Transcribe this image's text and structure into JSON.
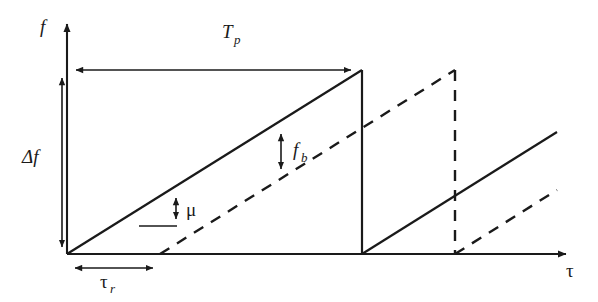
{
  "figure": {
    "background_color": "#ffffff",
    "line_color": "#1a1a1a",
    "width": 598,
    "height": 302
  },
  "axes": {
    "vertical": {
      "label": "f",
      "name": "frequency-axis",
      "x": 67,
      "y_top": 18,
      "y_bottom": 254,
      "label_x": 40,
      "label_y": 33
    },
    "horizontal": {
      "label": "τ",
      "name": "time-axis",
      "y": 254,
      "x_left": 67,
      "x_right": 572,
      "label_x": 566,
      "label_y": 277
    }
  },
  "labels": {
    "sweep_period": {
      "text": "T",
      "subscript": "p",
      "x": 222,
      "y": 38
    },
    "bandwidth": {
      "text": "Δf",
      "subscript": "",
      "x": 22,
      "y": 163
    },
    "round_trip_delay": {
      "text": "τ",
      "subscript": "r",
      "x": 100,
      "y": 288
    },
    "beat_frequency": {
      "text": "f",
      "subscript": "b",
      "x": 293,
      "y": 156
    },
    "chirp_rate": {
      "text": "μ",
      "subscript": "",
      "x": 186,
      "y": 216
    }
  },
  "dimensions": {
    "sweep_period_arrow": {
      "name": "sweep-period-dimension",
      "y": 70,
      "x_start": 70,
      "x_end": 358,
      "heads": "both"
    },
    "bandwidth_arrow": {
      "name": "bandwidth-dimension",
      "x": 62,
      "y_top": 70,
      "y_bottom": 254,
      "heads": "both"
    },
    "delay_arrow": {
      "name": "round-trip-delay-dimension",
      "y": 268,
      "x_start": 68,
      "x_end": 160,
      "heads": "both"
    },
    "beat_arrow": {
      "name": "beat-frequency-dimension",
      "x": 281,
      "y_top": 127,
      "y_bottom": 176,
      "heads": "both"
    },
    "slope_arrow": {
      "name": "chirp-rate-dimension",
      "x": 176,
      "y_top": 191,
      "y_bottom": 226,
      "heads": "both",
      "baseline_x_start": 139,
      "baseline_y": 226
    }
  },
  "waveform": {
    "transmit": {
      "name": "transmitted-chirp",
      "style": "solid",
      "segments": [
        {
          "type": "ramp",
          "x1": 67,
          "y1": 254,
          "x2": 362,
          "y2": 70
        },
        {
          "type": "drop",
          "x1": 362,
          "y1": 70,
          "x2": 362,
          "y2": 254
        },
        {
          "type": "ramp",
          "x1": 362,
          "y1": 254,
          "x2": 557,
          "y2": 132
        }
      ]
    },
    "receive": {
      "name": "received-chirp",
      "style": "dashed",
      "segments": [
        {
          "type": "ramp",
          "x1": 160,
          "y1": 254,
          "x2": 455,
          "y2": 70
        },
        {
          "type": "drop",
          "x1": 455,
          "y1": 70,
          "x2": 455,
          "y2": 254
        },
        {
          "type": "ramp",
          "x1": 455,
          "y1": 254,
          "x2": 557,
          "y2": 190
        }
      ]
    }
  }
}
